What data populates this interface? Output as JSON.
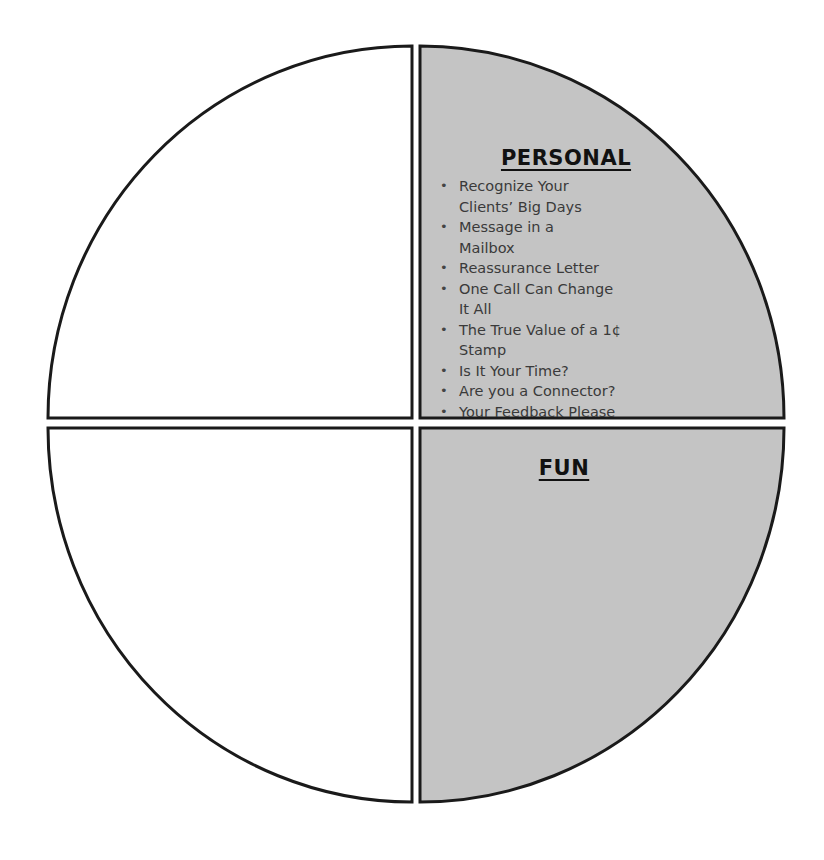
{
  "diagram": {
    "type": "quadrant-circle",
    "colors": {
      "filled_quadrant": "#c4c4c4",
      "empty_quadrant": "#ffffff",
      "stroke": "#1a1a1a",
      "text": "#3a3a3a"
    },
    "quadrants": {
      "top_left": {
        "label": "",
        "filled": false,
        "items": []
      },
      "top_right": {
        "label": "PERSONAL",
        "filled": true,
        "items": [
          "Recognize Your Clients’ Big Days",
          "Message in a Mailbox",
          "Reassurance Letter",
          "One Call Can Change It All",
          "The True Value of a 1¢ Stamp",
          "Is It Your Time?",
          "Are you a Connector?",
          "Your Feedback Please"
        ],
        "rendered_lines": [
          [
            "Recognize Your",
            "Clients’ Big Days"
          ],
          [
            "Message in a",
            "Mailbox"
          ],
          [
            "Reassurance Letter"
          ],
          [
            "One Call Can Change",
            "It All"
          ],
          [
            "The True Value of a 1¢",
            "Stamp"
          ],
          [
            "Is It Your Time?"
          ],
          [
            "Are you a Connector?"
          ],
          [
            "Your Feedback Please"
          ]
        ]
      },
      "bottom_left": {
        "label": "",
        "filled": false,
        "items": []
      },
      "bottom_right": {
        "label": "FUN",
        "filled": true,
        "items": []
      }
    }
  }
}
